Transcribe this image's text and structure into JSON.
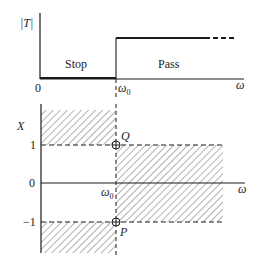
{
  "top_plot": {
    "y_label": "|T|",
    "x_label": "ω",
    "origin_label": "0",
    "cutoff_label": "ω",
    "cutoff_subscript": "0",
    "region_stop": "Stop",
    "region_pass": "Pass"
  },
  "bottom_plot": {
    "y_label": "X",
    "x_label": "ω",
    "tick_labels": [
      "1",
      "0",
      "−1"
    ],
    "cutoff_label": "ω",
    "cutoff_subscript": "0",
    "point_q": "Q",
    "point_p": "P"
  },
  "colors": {
    "ink": "#1a1a1a",
    "hatch": "#555555"
  }
}
